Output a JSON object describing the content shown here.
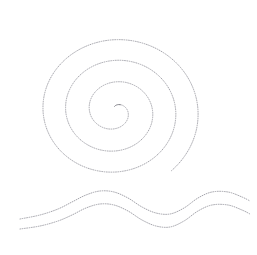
{
  "canvas": {
    "width": 257,
    "height": 255,
    "background_color": "#ffffff",
    "title": "Dotted Spiral and Waves"
  },
  "style": {
    "stroke_color": "#9a9aa2",
    "stroke_color_dark": "#6e6e76",
    "stroke_width": 0.9,
    "dash_pattern": "0.8 1.5",
    "dash_pattern_label": "dotted"
  },
  "figures": [
    {
      "id": "spiral",
      "name": "dotted-spiral",
      "kind": "spiral",
      "direction": "counterclockwise",
      "turns": 3.4,
      "center": {
        "x": 115,
        "y": 111
      },
      "r_start": 5,
      "r_end": 86,
      "theta_start_deg": 95,
      "squash_x": 1.0,
      "squash_y": 0.92,
      "bounds": {
        "left": 55,
        "top": 31,
        "right": 201,
        "bottom": 179
      }
    },
    {
      "id": "wave-upper",
      "name": "dotted-wave-upper",
      "kind": "wave",
      "points": [
        {
          "x": 20,
          "y": 219
        },
        {
          "x": 40,
          "y": 215
        },
        {
          "x": 58,
          "y": 209
        },
        {
          "x": 72,
          "y": 202
        },
        {
          "x": 86,
          "y": 195
        },
        {
          "x": 100,
          "y": 191
        },
        {
          "x": 114,
          "y": 192
        },
        {
          "x": 128,
          "y": 198
        },
        {
          "x": 142,
          "y": 207
        },
        {
          "x": 156,
          "y": 213
        },
        {
          "x": 170,
          "y": 214
        },
        {
          "x": 184,
          "y": 208
        },
        {
          "x": 198,
          "y": 198
        },
        {
          "x": 212,
          "y": 192
        },
        {
          "x": 228,
          "y": 192
        },
        {
          "x": 242,
          "y": 197
        },
        {
          "x": 250,
          "y": 201
        }
      ]
    },
    {
      "id": "wave-lower",
      "name": "dotted-wave-lower",
      "kind": "wave",
      "points": [
        {
          "x": 20,
          "y": 229
        },
        {
          "x": 40,
          "y": 226
        },
        {
          "x": 58,
          "y": 221
        },
        {
          "x": 72,
          "y": 215
        },
        {
          "x": 86,
          "y": 208
        },
        {
          "x": 100,
          "y": 204
        },
        {
          "x": 114,
          "y": 205
        },
        {
          "x": 128,
          "y": 211
        },
        {
          "x": 142,
          "y": 220
        },
        {
          "x": 156,
          "y": 226
        },
        {
          "x": 170,
          "y": 227
        },
        {
          "x": 184,
          "y": 221
        },
        {
          "x": 198,
          "y": 211
        },
        {
          "x": 212,
          "y": 205
        },
        {
          "x": 228,
          "y": 205
        },
        {
          "x": 242,
          "y": 210
        },
        {
          "x": 250,
          "y": 214
        }
      ]
    }
  ]
}
